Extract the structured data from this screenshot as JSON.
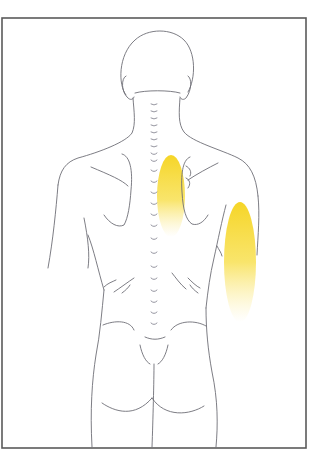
{
  "figure": {
    "description": "Posterior view of human torso with referred pain zones",
    "background": "#ffffff",
    "frame_color": "#5a5a5a",
    "line_color": "#6e6e76",
    "pain_color": "#f5d31c",
    "pain_zones": [
      {
        "name": "medial scapular zone",
        "cx": 171,
        "cy": 195,
        "rx": 14,
        "ry": 40
      },
      {
        "name": "posterior upper arm zone",
        "cx": 240,
        "cy": 260,
        "rx": 16,
        "ry": 58
      }
    ]
  }
}
